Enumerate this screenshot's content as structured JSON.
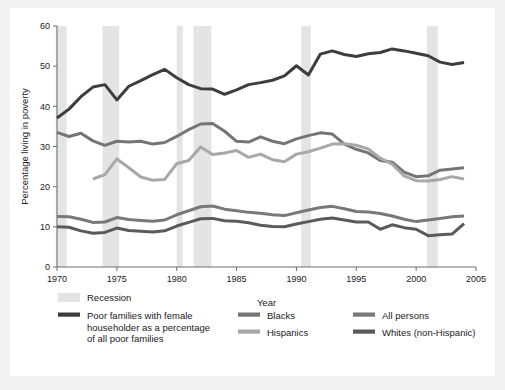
{
  "figure": {
    "background": "#ffffff",
    "page_background": "#f2f2f2"
  },
  "chart_data": {
    "type": "line",
    "title": "",
    "xlabel": "Year",
    "ylabel": "Percentage living in poverty",
    "xlim": [
      1970,
      2005
    ],
    "ylim": [
      0,
      60
    ],
    "xticks": [
      1970,
      1975,
      1980,
      1985,
      1990,
      1995,
      2000,
      2005
    ],
    "xtick_labels": [
      "1970",
      "1975",
      "1980",
      "1985",
      "1990",
      "1995",
      "2000",
      "2005"
    ],
    "yticks": [
      0,
      10,
      20,
      30,
      40,
      50,
      60
    ],
    "ytick_labels": [
      "0",
      "10",
      "20",
      "30",
      "40",
      "50",
      "60"
    ],
    "grid": false,
    "legend_position": "below",
    "recession_label": "Recession",
    "recession_color": "#e4e4e4",
    "recessions": [
      {
        "start": 1969.9,
        "end": 1970.8
      },
      {
        "start": 1973.8,
        "end": 1975.2
      },
      {
        "start": 1980.0,
        "end": 1980.5
      },
      {
        "start": 1981.4,
        "end": 1982.9
      },
      {
        "start": 1990.4,
        "end": 1991.2
      },
      {
        "start": 2000.9,
        "end": 2001.8
      }
    ],
    "series": [
      {
        "name": "Poor families with female householder as a percentage of all poor families",
        "legend_name": "Poor families with female householder as a percentage of all poor families",
        "color": "#3d3d3d",
        "width": 3.0,
        "x": [
          1970,
          1971,
          1972,
          1973,
          1974,
          1975,
          1976,
          1977,
          1978,
          1979,
          1980,
          1981,
          1982,
          1983,
          1984,
          1985,
          1986,
          1987,
          1988,
          1989,
          1990,
          1991,
          1992,
          1993,
          1994,
          1995,
          1996,
          1997,
          1998,
          1999,
          2000,
          2001,
          2002,
          2003,
          2004
        ],
        "values": [
          37.1,
          39.3,
          42.4,
          44.8,
          45.4,
          41.6,
          45.0,
          46.4,
          47.9,
          49.2,
          47.1,
          45.4,
          44.4,
          44.3,
          43.0,
          44.1,
          45.4,
          45.9,
          46.5,
          47.6,
          50.1,
          47.8,
          53.0,
          53.8,
          52.9,
          52.4,
          53.1,
          53.4,
          54.3,
          53.8,
          53.2,
          52.6,
          51.0,
          50.4,
          50.9
        ]
      },
      {
        "name": "Blacks",
        "legend_name": "Blacks",
        "color": "#757575",
        "width": 3.0,
        "x": [
          1970,
          1971,
          1972,
          1973,
          1974,
          1975,
          1976,
          1977,
          1978,
          1979,
          1980,
          1981,
          1982,
          1983,
          1984,
          1985,
          1986,
          1987,
          1988,
          1989,
          1990,
          1991,
          1992,
          1993,
          1994,
          1995,
          1996,
          1997,
          1998,
          1999,
          2000,
          2001,
          2002,
          2003,
          2004
        ],
        "values": [
          33.5,
          32.5,
          33.3,
          31.4,
          30.3,
          31.3,
          31.1,
          31.3,
          30.6,
          31.0,
          32.5,
          34.2,
          35.6,
          35.7,
          33.8,
          31.3,
          31.1,
          32.4,
          31.3,
          30.7,
          31.9,
          32.7,
          33.4,
          33.1,
          30.6,
          29.3,
          28.4,
          26.5,
          26.1,
          23.6,
          22.5,
          22.7,
          24.1,
          24.4,
          24.7
        ]
      },
      {
        "name": "Hispanics",
        "legend_name": "Hispanics",
        "color": "#a8a8a8",
        "width": 3.0,
        "x": [
          1973,
          1974,
          1975,
          1976,
          1977,
          1978,
          1979,
          1980,
          1981,
          1982,
          1983,
          1984,
          1985,
          1986,
          1987,
          1988,
          1989,
          1990,
          1991,
          1992,
          1993,
          1994,
          1995,
          1996,
          1997,
          1998,
          1999,
          2000,
          2001,
          2002,
          2003,
          2004
        ],
        "values": [
          21.9,
          23.0,
          26.9,
          24.7,
          22.4,
          21.6,
          21.8,
          25.7,
          26.5,
          29.9,
          28.0,
          28.4,
          29.0,
          27.3,
          28.1,
          26.7,
          26.2,
          28.1,
          28.7,
          29.6,
          30.6,
          30.7,
          30.3,
          29.4,
          27.1,
          25.6,
          22.7,
          21.5,
          21.4,
          21.8,
          22.5,
          21.9
        ]
      },
      {
        "name": "All persons",
        "legend_name": "All persons",
        "color": "#787878",
        "width": 3.0,
        "x": [
          1970,
          1971,
          1972,
          1973,
          1974,
          1975,
          1976,
          1977,
          1978,
          1979,
          1980,
          1981,
          1982,
          1983,
          1984,
          1985,
          1986,
          1987,
          1988,
          1989,
          1990,
          1991,
          1992,
          1993,
          1994,
          1995,
          1996,
          1997,
          1998,
          1999,
          2000,
          2001,
          2002,
          2003,
          2004
        ],
        "values": [
          12.6,
          12.5,
          11.9,
          11.1,
          11.2,
          12.3,
          11.8,
          11.6,
          11.4,
          11.7,
          13.0,
          14.0,
          15.0,
          15.2,
          14.4,
          14.0,
          13.6,
          13.4,
          13.0,
          12.8,
          13.5,
          14.2,
          14.8,
          15.1,
          14.5,
          13.8,
          13.7,
          13.3,
          12.7,
          11.9,
          11.3,
          11.7,
          12.1,
          12.5,
          12.7
        ]
      },
      {
        "name": "Whites (non-Hispanic)",
        "legend_name": "Whites (non-Hispanic)",
        "color": "#5a5a5a",
        "width": 3.0,
        "x": [
          1970,
          1971,
          1972,
          1973,
          1974,
          1975,
          1976,
          1977,
          1978,
          1979,
          1980,
          1981,
          1982,
          1983,
          1984,
          1985,
          1986,
          1987,
          1988,
          1989,
          1990,
          1991,
          1992,
          1993,
          1994,
          1995,
          1996,
          1997,
          1998,
          1999,
          2000,
          2001,
          2002,
          2003,
          2004
        ],
        "values": [
          10.0,
          9.9,
          9.0,
          8.4,
          8.6,
          9.7,
          9.1,
          8.9,
          8.7,
          9.0,
          10.2,
          11.1,
          12.0,
          12.1,
          11.5,
          11.4,
          11.0,
          10.4,
          10.1,
          10.0,
          10.7,
          11.3,
          11.9,
          12.2,
          11.7,
          11.2,
          11.2,
          9.4,
          10.5,
          9.8,
          9.4,
          7.8,
          8.0,
          8.2,
          10.8
        ]
      }
    ]
  },
  "legend": {
    "recession": {
      "label": "Recession",
      "swatch_color": "#e4e4e4"
    },
    "entries": [
      {
        "label_line1": "Poor families with female",
        "label_line2": "householder as a percentage",
        "label_line3": "of all poor families",
        "color": "#3d3d3d"
      },
      {
        "label_line1": "Blacks",
        "color": "#757575"
      },
      {
        "label_line1": "Hispanics",
        "color": "#a8a8a8"
      },
      {
        "label_line1": "All persons",
        "color": "#787878"
      },
      {
        "label_line1": "Whites (non-Hispanic)",
        "color": "#5a5a5a"
      }
    ]
  }
}
